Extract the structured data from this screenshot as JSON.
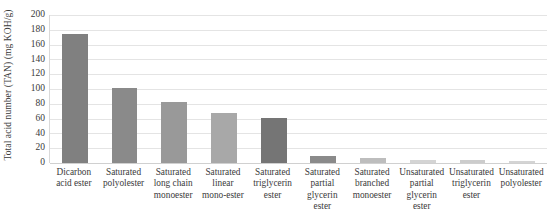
{
  "chart_data": {
    "type": "bar",
    "title": "",
    "xlabel": "",
    "ylabel": "Total acid number (TAN) (mg KOH/g)",
    "ylim": [
      0,
      200
    ],
    "ytick_step": 20,
    "yticks": [
      "0",
      "20",
      "40",
      "60",
      "80",
      "100",
      "120",
      "140",
      "160",
      "180",
      "200"
    ],
    "grid": true,
    "legend": "none",
    "categories": [
      "Dicarbon acid ester",
      "Saturated polyolester",
      "Saturated long chain monoester",
      "Saturated linear mono-ester",
      "Saturated triglycerin ester",
      "Saturated partial glycerin ester",
      "Saturated branched monoester",
      "Unsaturated partial glycerin ester",
      "Unsaturated triglycerin ester",
      "Unsaturated polyolester"
    ],
    "values": [
      175,
      101,
      82,
      67,
      61,
      9,
      7,
      4,
      4,
      3
    ],
    "bar_colors": [
      "#808080",
      "#8a8a8a",
      "#999999",
      "#a8a8a8",
      "#757575",
      "#8a8a8a",
      "#bdbdbd",
      "#d4d4d4",
      "#cccccc",
      "#d4d4d4"
    ],
    "grid_color": "#e4e4e4",
    "axis_color": "#d9d9d9",
    "text_color": "#3a3a3a",
    "background": "#ffffff"
  }
}
